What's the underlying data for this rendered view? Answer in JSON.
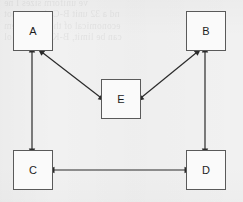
{
  "canvas": {
    "width": 243,
    "height": 202,
    "background_color": "#f1f1f1",
    "paper_note": "scanned page with faint reverse-side bleed-through at top"
  },
  "bleed_through_text": "ve  uniform   sizes  I   ne\nnd  a 32  unit  B-C-that  per  not\neconomical  of  the  B-theorem\ncan  be  limit,  B-K-Mu  will  lol",
  "diagram": {
    "type": "node-link-graph",
    "line_color": "#2b2b2b",
    "box_border_color": "#5a5a5a",
    "box_fill_color": "#fafafa",
    "nodes": [
      {
        "id": "A",
        "label": "A",
        "x": 13,
        "y": 11,
        "w": 40,
        "h": 40
      },
      {
        "id": "B",
        "label": "B",
        "x": 186,
        "y": 11,
        "w": 40,
        "h": 40
      },
      {
        "id": "E",
        "label": "E",
        "x": 101,
        "y": 79,
        "w": 40,
        "h": 40
      },
      {
        "id": "C",
        "label": "C",
        "x": 13,
        "y": 150,
        "w": 40,
        "h": 40
      },
      {
        "id": "D",
        "label": "D",
        "x": 186,
        "y": 150,
        "w": 40,
        "h": 40
      }
    ],
    "edges": [
      {
        "id": "A-C",
        "from": "A",
        "to": "C",
        "arrow": "double",
        "orientation": "vertical",
        "x1": 32,
        "y1": 52,
        "x2": 32,
        "y2": 149
      },
      {
        "id": "B-D",
        "from": "B",
        "to": "D",
        "arrow": "double",
        "orientation": "vertical",
        "x1": 205,
        "y1": 52,
        "x2": 205,
        "y2": 149
      },
      {
        "id": "C-D",
        "from": "C",
        "to": "D",
        "arrow": "double",
        "orientation": "horizontal",
        "x1": 54,
        "y1": 170,
        "x2": 185,
        "y2": 170
      },
      {
        "id": "A-E",
        "from": "A",
        "to": "E",
        "arrow": "double",
        "orientation": "diagonal",
        "x1": 43,
        "y1": 53,
        "x2": 100,
        "y2": 97
      },
      {
        "id": "B-E",
        "from": "B",
        "to": "E",
        "arrow": "double",
        "orientation": "diagonal",
        "x1": 196,
        "y1": 53,
        "x2": 142,
        "y2": 97
      }
    ]
  }
}
